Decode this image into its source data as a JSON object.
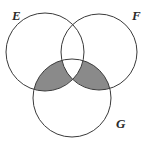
{
  "figure": {
    "kind": "venn-diagram",
    "width": 148,
    "height": 145,
    "background_color": "#ffffff",
    "stroke_color": "#3a3a3a",
    "stroke_width": 1,
    "shade_color": "#8a8a8a",
    "shade_stroke_color": "#3a3a3a"
  },
  "sets": [
    {
      "id": "E",
      "label": "E",
      "label_x": 12,
      "label_y": 20,
      "center_x": 45,
      "center_y": 52,
      "radius": 39,
      "position": "top-left"
    },
    {
      "id": "F",
      "label": "F",
      "label_x": 132,
      "label_y": 20,
      "center_x": 99,
      "center_y": 52,
      "radius": 38,
      "position": "top-right"
    },
    {
      "id": "G",
      "label": "G",
      "label_x": 116,
      "label_y": 128,
      "center_x": 72,
      "center_y": 98,
      "radius": 39,
      "position": "bottom-center"
    }
  ],
  "shaded_regions": [
    {
      "id": "E-and-G-not-F",
      "description": "E intersect G, excluding F",
      "fill": "#8a8a8a"
    },
    {
      "id": "F-and-G-not-E",
      "description": "F intersect G, excluding E",
      "fill": "#8a8a8a"
    }
  ],
  "unshaded_regions": [
    {
      "id": "E-and-F-and-G",
      "description": "E intersect F intersect G",
      "fill": "#ffffff"
    }
  ]
}
